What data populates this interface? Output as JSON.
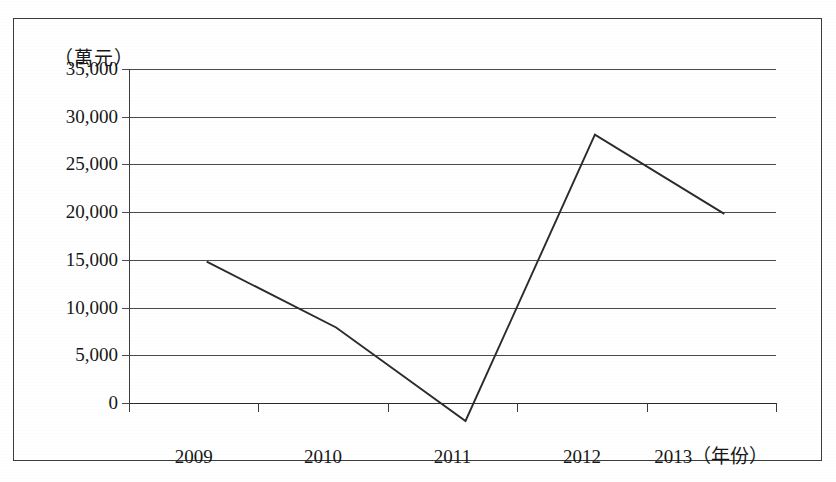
{
  "chart_data": {
    "type": "line",
    "title": "",
    "subtitle": "",
    "xlabel": "年份",
    "ylabel": "萬元",
    "y_unit_caption": "（萬元）",
    "x_axis_caption": "（年份）",
    "categories": [
      "2009",
      "2010",
      "2011",
      "2012",
      "2013"
    ],
    "series": [
      {
        "name": "金額",
        "values": [
          16700,
          9800,
          0,
          30000,
          21700
        ]
      }
    ],
    "ylim": [
      0,
      35000
    ],
    "y_ticks": [
      0,
      5000,
      10000,
      15000,
      20000,
      25000,
      30000,
      35000
    ],
    "y_tick_labels": [
      "0",
      "5,000",
      "10,000",
      "15,000",
      "20,000",
      "25,000",
      "30,000",
      "35,000"
    ],
    "x_tick_labels": [
      "2009",
      "2010",
      "2011",
      "2012",
      "2013（年份）"
    ],
    "grid": true,
    "grid_axis": "y",
    "legend": false,
    "legend_position": "none",
    "line_color": "#2b2b2b",
    "grid_color": "#4a4a4a",
    "axis_color": "#3c3c3c",
    "background_color": "#ffffff",
    "markers": false,
    "annotations": []
  },
  "figure": {
    "border_color": "#3c3c3c",
    "background": "#ffffff"
  }
}
